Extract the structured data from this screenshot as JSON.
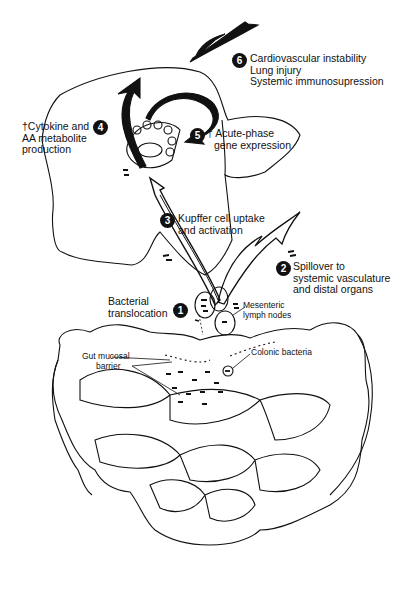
{
  "diagram": {
    "steps": [
      {
        "number": "1",
        "lines": [
          "Bacterial",
          "translocation"
        ]
      },
      {
        "number": "2",
        "lines": [
          "Spillover to",
          "systemic vasculature",
          "and distal organs"
        ]
      },
      {
        "number": "3",
        "lines": [
          "Kupffer cell uptake",
          "and activation"
        ]
      },
      {
        "number": "4",
        "lines": [
          "†Cytokine and",
          "AA metabolite",
          "production"
        ]
      },
      {
        "number": "5",
        "lines": [
          "† Acute-phase",
          "gene expression"
        ]
      },
      {
        "number": "6",
        "lines": [
          "Cardiovascular instability",
          "Lung injury",
          "Systemic immunosupression"
        ]
      }
    ],
    "callouts": {
      "mesenteric": [
        "Mesenteric",
        "lymph nodes"
      ],
      "colonic": "Colonic bacteria",
      "barrier": [
        "Gut mucosal",
        "barrier"
      ]
    }
  }
}
